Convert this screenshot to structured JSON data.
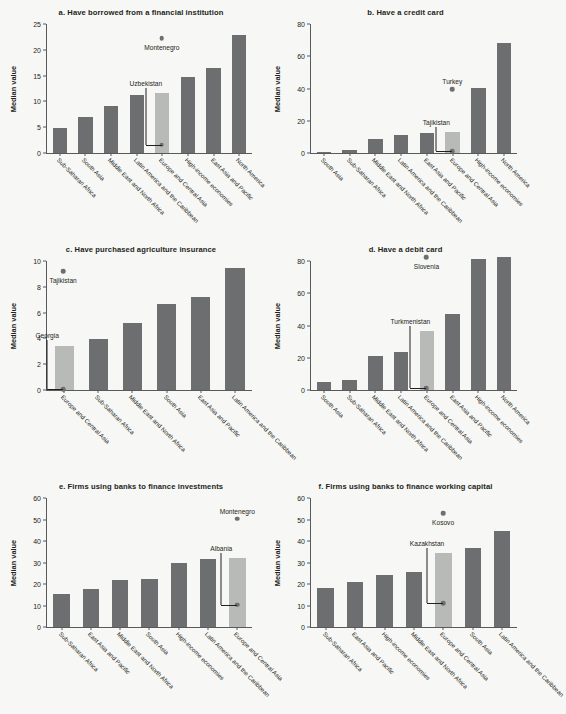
{
  "figure": {
    "background": "#f7f7f5",
    "bar_color": "#6d6e70",
    "highlight_color": "#b8bab7",
    "axis_color": "#58595b",
    "ylabel": "Median value"
  },
  "chart_data": [
    {
      "type": "bar",
      "panel": "a",
      "title": "a. Have borrowed from a financial institution",
      "ylabel": "Median value",
      "xlabel": "",
      "ylim": [
        0,
        25
      ],
      "yticks": [
        0,
        5,
        10,
        15,
        20,
        25
      ],
      "grid": false,
      "legend": "none",
      "categories": [
        "Sub-Saharan Africa",
        "South Asia",
        "Middle East and North Africa",
        "Latin America and the Caribbean",
        "Europe and Central Asia",
        "High-income economies",
        "East Asia and Pacific",
        "North America"
      ],
      "values": [
        4.8,
        7.0,
        9.1,
        11.2,
        11.7,
        14.8,
        16.5,
        22.8
      ],
      "highlight_index": 4,
      "annotations": [
        {
          "label": "Montenegro",
          "value": 22.2,
          "category": "Europe and Central Asia",
          "kind": "point-above"
        },
        {
          "label": "Uzbekistan",
          "value": 1.6,
          "category": "Europe and Central Asia",
          "kind": "point-leader"
        }
      ]
    },
    {
      "type": "bar",
      "panel": "b",
      "title": "b. Have a credit card",
      "ylabel": "Median value",
      "xlabel": "",
      "ylim": [
        0,
        80
      ],
      "yticks": [
        0,
        20,
        40,
        60,
        80
      ],
      "grid": false,
      "legend": "none",
      "categories": [
        "South Asia",
        "Sub-Saharan Africa",
        "Middle East and North Africa",
        "Latin America and the Caribbean",
        "East Asia and Pacific",
        "Europe and Central Asia",
        "High-income economies",
        "North America"
      ],
      "values": [
        0.4,
        1.8,
        9.0,
        11.0,
        12.3,
        13.3,
        40.6,
        68.2
      ],
      "highlight_index": 5,
      "annotations": [
        {
          "label": "Turkey",
          "value": 39.5,
          "category": "Europe and Central Asia",
          "kind": "point-above"
        },
        {
          "label": "Tajikistan",
          "value": 1.1,
          "category": "Europe and Central Asia",
          "kind": "point-leader"
        }
      ]
    },
    {
      "type": "bar",
      "panel": "c",
      "title": "c. Have purchased agriculture insurance",
      "ylabel": "Median value",
      "xlabel": "",
      "ylim": [
        0,
        10
      ],
      "yticks": [
        0,
        2,
        4,
        6,
        8,
        10
      ],
      "grid": false,
      "legend": "none",
      "categories": [
        "Europe and Central Asia",
        "Sub-Saharan Africa",
        "Middle East and North Africa",
        "South Asia",
        "East Asia and Pacific",
        "Latin America and the Caribbean"
      ],
      "values": [
        3.45,
        3.95,
        5.2,
        6.65,
        7.2,
        9.45
      ],
      "highlight_index": 0,
      "annotations": [
        {
          "label": "Tajikistan",
          "value": 9.2,
          "category": "Europe and Central Asia",
          "kind": "point-above"
        },
        {
          "label": "Georgia",
          "value": 0.05,
          "category": "Europe and Central Asia",
          "kind": "point-leader"
        }
      ]
    },
    {
      "type": "bar",
      "panel": "d",
      "title": "d. Have a debit card",
      "ylabel": "Median value",
      "xlabel": "",
      "ylim": [
        0,
        80
      ],
      "yticks": [
        0,
        20,
        40,
        60,
        80
      ],
      "grid": false,
      "legend": "none",
      "categories": [
        "South Asia",
        "Sub-Saharan Africa",
        "Middle East and North Africa",
        "Latin America and the Caribbean",
        "Europe and Central Asia",
        "East Asia and Pacific",
        "High-income economies",
        "North America"
      ],
      "values": [
        5.2,
        6.1,
        21.4,
        23.3,
        36.5,
        47.0,
        81.5,
        82.5
      ],
      "highlight_index": 4,
      "annotations": [
        {
          "label": "Slovenia",
          "value": 82.5,
          "category": "Europe and Central Asia",
          "kind": "point-above"
        },
        {
          "label": "Turkmenistan",
          "value": 1.0,
          "category": "Europe and Central Asia",
          "kind": "point-leader"
        }
      ]
    },
    {
      "type": "bar",
      "panel": "e",
      "title": "e. Firms using banks to finance investments",
      "ylabel": "Median value",
      "xlabel": "",
      "ylim": [
        0,
        60
      ],
      "yticks": [
        0,
        10,
        20,
        30,
        40,
        50,
        60
      ],
      "grid": false,
      "legend": "none",
      "categories": [
        "Sub-Saharan Africa",
        "East Asia and Pacific",
        "Middle East and North Africa",
        "South Asia",
        "High-income economies",
        "Latin America and the Caribbean",
        "Europe and Central Asia"
      ],
      "values": [
        15.2,
        17.9,
        21.9,
        22.3,
        29.9,
        31.8,
        32.3
      ],
      "highlight_index": 6,
      "annotations": [
        {
          "label": "Montenegro",
          "value": 50.3,
          "category": "Europe and Central Asia",
          "kind": "point-above"
        },
        {
          "label": "Albania",
          "value": 10.4,
          "category": "Europe and Central Asia",
          "kind": "point-leader"
        }
      ]
    },
    {
      "type": "bar",
      "panel": "f",
      "title": "f. Firms using banks to finance working capital",
      "ylabel": "Median value",
      "xlabel": "",
      "ylim": [
        0,
        60
      ],
      "yticks": [
        0,
        10,
        20,
        30,
        40,
        50,
        60
      ],
      "grid": false,
      "legend": "none",
      "categories": [
        "Sub-Saharan Africa",
        "East Asia and Pacific",
        "High-income economies",
        "Middle East and North Africa",
        "Europe and Central Asia",
        "South Asia",
        "Latin America and the Caribbean"
      ],
      "values": [
        18.2,
        20.9,
        24.4,
        25.7,
        34.5,
        36.6,
        44.6
      ],
      "highlight_index": 4,
      "annotations": [
        {
          "label": "Kosovo",
          "value": 52.8,
          "category": "Europe and Central Asia",
          "kind": "point-above"
        },
        {
          "label": "Kazakhstan",
          "value": 11.2,
          "category": "Europe and Central Asia",
          "kind": "point-leader"
        }
      ]
    }
  ]
}
